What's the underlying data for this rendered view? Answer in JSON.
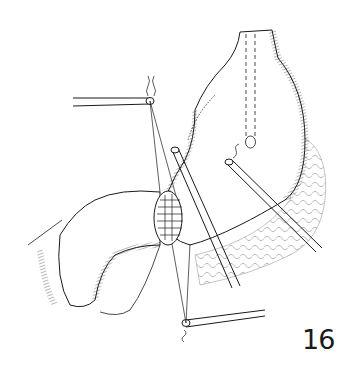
{
  "figure": {
    "number": "16"
  },
  "colors": {
    "ink": "#1a1a1a",
    "background": "#ffffff"
  }
}
